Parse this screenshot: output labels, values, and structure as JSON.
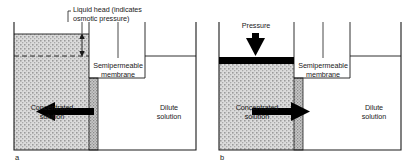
{
  "figure": {
    "background_color": "#ffffff",
    "line_color": "#1a1a1a",
    "fill_color": "#d0d0d0",
    "piston_color": "#000000",
    "arrow_color": "#000000"
  },
  "panels": [
    {
      "tag": "a",
      "process": "osmosis",
      "callout": {
        "label": "Liquid head (indicates\nosmotic pressure)",
        "measure_icon": "double-headed-vertical-arrow"
      },
      "membrane_label": "Semipermeable\nmembrane",
      "left_chamber_label": "Concentrated\nsolution",
      "right_chamber_label": "Dilute\nsolution",
      "flow_direction": "left",
      "flow_icon": "left-arrow",
      "reference_line_style": "dashed"
    },
    {
      "tag": "b",
      "process": "reverse-osmosis",
      "callout": {
        "label": "Pressure",
        "measure_icon": "down-arrow"
      },
      "membrane_label": "Semipermeable\nmembrane",
      "left_chamber_label": "Concentrated\nsolution",
      "right_chamber_label": "Dilute\nsolution",
      "flow_direction": "right",
      "flow_icon": "right-arrow",
      "piston": "pressure-piston-bar"
    }
  ]
}
